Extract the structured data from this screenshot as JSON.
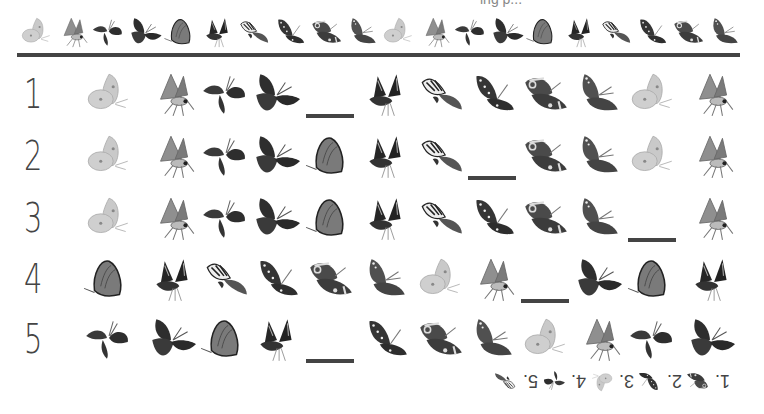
{
  "worksheet": {
    "top_text": "ing p...",
    "header_sequence": [
      "sulphur",
      "hairstreak",
      "skipper",
      "monarch",
      "fritillary",
      "dark-swallowtail",
      "tiger-swallowtail",
      "admiral",
      "buckeye",
      "painted-lady",
      "sulphur",
      "hairstreak",
      "skipper",
      "monarch",
      "fritillary",
      "dark-swallowtail",
      "tiger-swallowtail",
      "admiral",
      "buckeye",
      "painted-lady"
    ],
    "rows": [
      {
        "number": "1",
        "items": [
          "sulphur",
          "hairstreak",
          "skipper",
          "monarch",
          "_blank",
          "dark-swallowtail",
          "tiger-swallowtail",
          "admiral",
          "buckeye",
          "painted-lady",
          "sulphur",
          "hairstreak"
        ]
      },
      {
        "number": "2",
        "items": [
          "sulphur",
          "hairstreak",
          "skipper",
          "monarch",
          "fritillary",
          "dark-swallowtail",
          "tiger-swallowtail",
          "_blank",
          "buckeye",
          "painted-lady",
          "sulphur",
          "hairstreak"
        ]
      },
      {
        "number": "3",
        "items": [
          "sulphur",
          "hairstreak",
          "skipper",
          "monarch",
          "fritillary",
          "dark-swallowtail",
          "tiger-swallowtail",
          "admiral",
          "buckeye",
          "painted-lady",
          "_blank",
          "hairstreak"
        ]
      },
      {
        "number": "4",
        "items": [
          "fritillary",
          "dark-swallowtail",
          "tiger-swallowtail",
          "admiral",
          "buckeye",
          "painted-lady",
          "sulphur",
          "hairstreak",
          "_blank",
          "monarch",
          "fritillary",
          "dark-swallowtail"
        ]
      },
      {
        "number": "5",
        "items": [
          "skipper",
          "monarch",
          "fritillary",
          "dark-swallowtail",
          "_blank",
          "admiral",
          "buckeye",
          "painted-lady",
          "sulphur",
          "hairstreak",
          "skipper",
          "monarch"
        ]
      }
    ],
    "answers": [
      {
        "label": "1.",
        "butterfly": "buckeye"
      },
      {
        "label": "2.",
        "butterfly": "admiral"
      },
      {
        "label": "3.",
        "butterfly": "sulphur"
      },
      {
        "label": "4.",
        "butterfly": "skipper"
      },
      {
        "label": "5.",
        "butterfly": "tiger-swallowtail"
      }
    ],
    "colors": {
      "sulphur": "#c9c9c9",
      "hairstreak": "#8f8f8f",
      "skipper": "#3a3a3a",
      "monarch": "#2e2e2e",
      "fritillary": "#7a7a7a",
      "dark-swallowtail": "#262626",
      "tiger-swallowtail": "#555555",
      "admiral": "#353535",
      "buckeye": "#4a4a4a",
      "painted-lady": "#505050",
      "rule": "#444444"
    }
  }
}
